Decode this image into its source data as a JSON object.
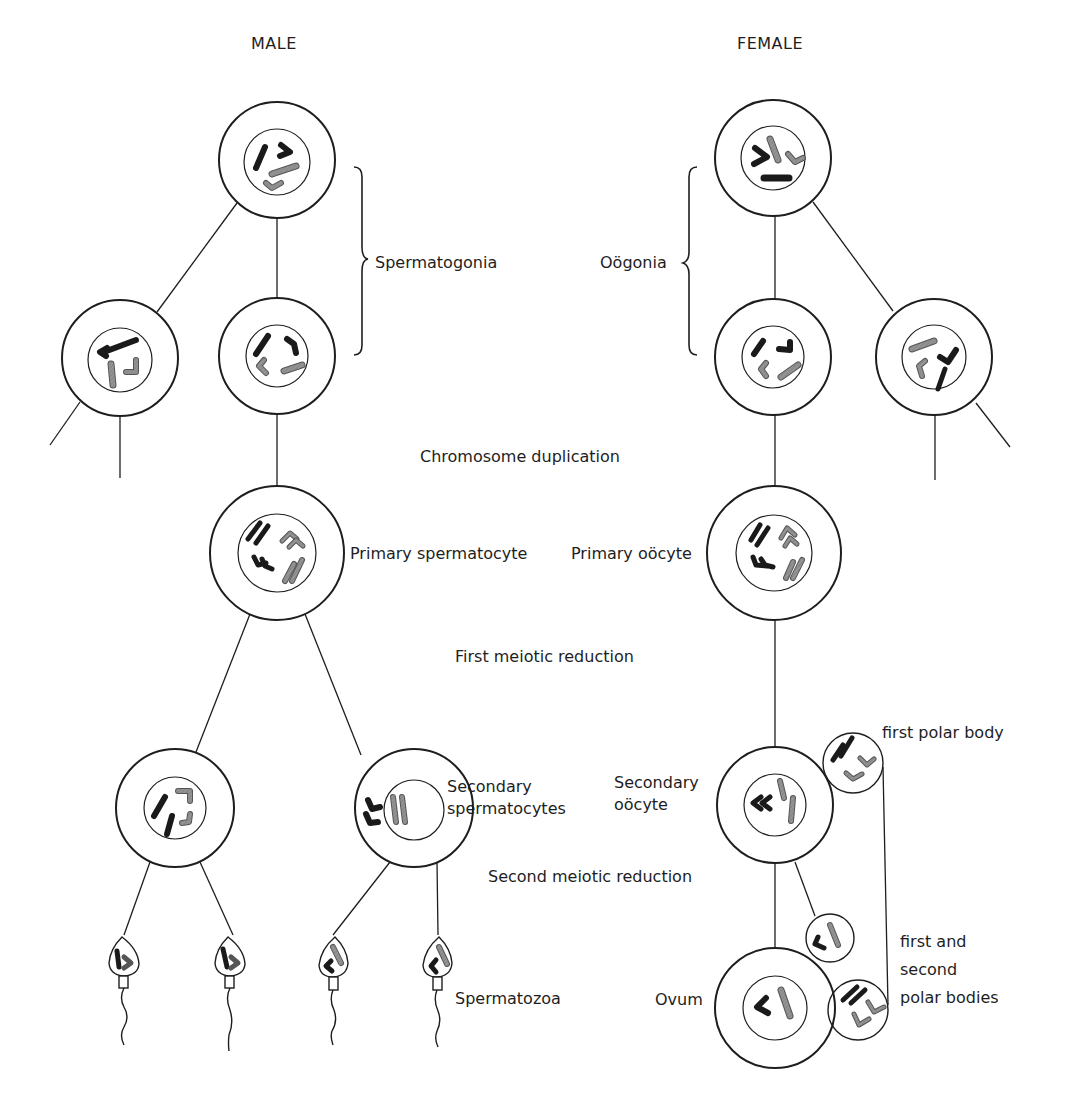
{
  "headers": {
    "male": "MALE",
    "female": "FEMALE"
  },
  "stages": {
    "chromosome_duplication": "Chromosome duplication",
    "first_meiotic_reduction": "First meiotic reduction",
    "second_meiotic_reduction": "Second meiotic reduction"
  },
  "male_labels": {
    "spermatogonia": "Spermatogonia",
    "primary_spermatocyte": "Primary spermatocyte",
    "secondary_spermatocytes": [
      "Secondary",
      "spermatocytes"
    ],
    "spermatozoa": "Spermatozoa"
  },
  "female_labels": {
    "oogonia": "Oögonia",
    "primary_oocyte": "Primary oöcyte",
    "secondary_oocyte": [
      "Secondary",
      "oöcyte"
    ],
    "first_polar_body": "first polar body",
    "first_and_second_polar_bodies": [
      "first and",
      "second",
      "polar bodies"
    ],
    "ovum": "Ovum"
  },
  "colors": {
    "line": "#1e1e1e",
    "chromosome_dark": "#1a1a1a",
    "chromosome_gray": "#8a8a8a",
    "background": "#ffffff"
  }
}
